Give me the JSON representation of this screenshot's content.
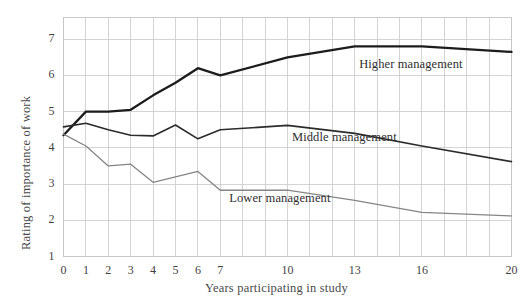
{
  "chart_data": {
    "type": "line",
    "title": "",
    "xlabel": "Years participating in study",
    "ylabel": "Rating of importance of work",
    "xlim": [
      0,
      20
    ],
    "ylim": [
      1,
      7.6
    ],
    "grid": true,
    "legend_position": "inline-annotations",
    "x_tick_values": [
      0,
      1,
      2,
      3,
      4,
      5,
      6,
      7,
      10,
      13,
      16,
      20
    ],
    "x_tick_labels": [
      "0",
      "1",
      "2",
      "3",
      "4",
      "5",
      "6",
      "7",
      "10",
      "13",
      "16",
      "20"
    ],
    "y_tick_values": [
      1,
      2,
      3,
      4,
      5,
      6,
      7
    ],
    "y_tick_labels": [
      "1",
      "2",
      "3",
      "4",
      "5",
      "6",
      "7"
    ],
    "x_gridlines": [
      0,
      1,
      2,
      3,
      4,
      5,
      6,
      7,
      8,
      9,
      10,
      11,
      12,
      13,
      14,
      15,
      16,
      17,
      18,
      19,
      20
    ],
    "y_gridlines": [
      1,
      2,
      3,
      4,
      5,
      6,
      7
    ],
    "series": [
      {
        "name": "Higher management",
        "color": "#1c1c1c",
        "width": 2.3,
        "label_x": 13.2,
        "label_y": 6.3,
        "x": [
          0,
          1,
          2,
          3,
          4,
          5,
          6,
          7,
          10,
          13,
          16,
          20
        ],
        "values": [
          4.35,
          5.0,
          5.0,
          5.05,
          5.45,
          5.8,
          6.2,
          6.0,
          6.5,
          6.8,
          6.8,
          6.65
        ]
      },
      {
        "name": "Middle management",
        "color": "#2b2b2b",
        "width": 1.6,
        "label_x": 10.2,
        "label_y": 4.28,
        "x": [
          0,
          1,
          2,
          3,
          4,
          5,
          6,
          7,
          10,
          13,
          16,
          20
        ],
        "values": [
          4.58,
          4.68,
          4.5,
          4.35,
          4.33,
          4.63,
          4.25,
          4.5,
          4.62,
          4.4,
          4.05,
          3.62
        ]
      },
      {
        "name": "Lower management",
        "color": "#858585",
        "width": 1.3,
        "label_x": 7.4,
        "label_y": 2.6,
        "x": [
          0,
          1,
          2,
          3,
          4,
          5,
          6,
          7,
          10,
          13,
          16,
          20
        ],
        "values": [
          4.38,
          4.05,
          3.5,
          3.55,
          3.05,
          3.2,
          3.35,
          2.83,
          2.83,
          2.55,
          2.22,
          2.12
        ]
      }
    ]
  },
  "axis": {
    "ylabel_text": "Rating of importance of work",
    "xlabel_text": "Years participating in study"
  }
}
